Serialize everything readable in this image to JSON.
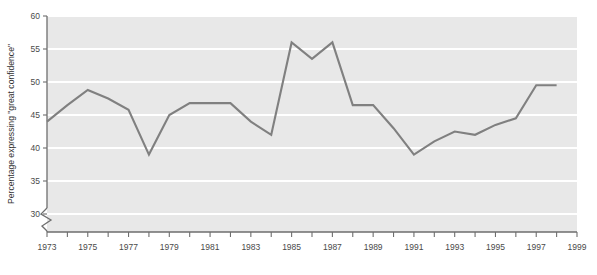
{
  "chart_data": {
    "type": "line",
    "title": "",
    "subtitle": "",
    "xlabel": "",
    "ylabel": "Percentage expressing \"great confidence\"",
    "ylim": [
      30,
      60
    ],
    "xlim": [
      1973,
      1999
    ],
    "ytick_step": 5,
    "ytick_labels": [
      "30",
      "35",
      "40",
      "45",
      "50",
      "55",
      "60"
    ],
    "ytick_values": [
      30,
      35,
      40,
      45,
      50,
      55,
      60
    ],
    "xtick_values": [
      1973,
      1974,
      1975,
      1976,
      1977,
      1978,
      1979,
      1980,
      1981,
      1982,
      1983,
      1984,
      1985,
      1986,
      1987,
      1988,
      1989,
      1990,
      1991,
      1992,
      1993,
      1994,
      1995,
      1996,
      1997,
      1998,
      1999
    ],
    "xtick_labels": [
      "1973",
      "",
      "1975",
      "",
      "1977",
      "",
      "1979",
      "",
      "1981",
      "",
      "1983",
      "",
      "1985",
      "",
      "1987",
      "",
      "1989",
      "",
      "1991",
      "",
      "1993",
      "",
      "1995",
      "",
      "1997",
      "",
      "1999"
    ],
    "grid": true,
    "grid_axis": "y",
    "legend": false,
    "legend_position": "none",
    "axis_break": true,
    "axis_break_axis": "y",
    "axis_break_note": "zigzag break on y-axis below 30",
    "plot_bg_color": "#e8e8e8",
    "gridline_color": "#ffffff",
    "line_color": "#808080",
    "axis_color": "#6e6e6e",
    "x": [
      1973,
      1974,
      1975,
      1976,
      1977,
      1978,
      1979,
      1980,
      1981,
      1982,
      1983,
      1984,
      1985,
      1986,
      1987,
      1988,
      1989,
      1990,
      1991,
      1992,
      1993,
      1994,
      1995,
      1996,
      1997,
      1998
    ],
    "values": [
      44.0,
      46.5,
      48.8,
      47.5,
      45.8,
      39.0,
      45.0,
      46.8,
      46.8,
      46.8,
      44.0,
      42.0,
      56.0,
      53.5,
      56.0,
      46.5,
      46.5,
      43.0,
      39.0,
      41.0,
      42.5,
      42.0,
      43.5,
      44.5,
      49.5,
      49.5
    ],
    "series": [
      {
        "name": "Percentage expressing \"great confidence\"",
        "color": "#808080",
        "values": [
          44.0,
          46.5,
          48.8,
          47.5,
          45.8,
          39.0,
          45.0,
          46.8,
          46.8,
          46.8,
          44.0,
          42.0,
          56.0,
          53.5,
          56.0,
          46.5,
          46.5,
          43.0,
          39.0,
          41.0,
          42.5,
          42.0,
          43.5,
          44.5,
          49.5,
          49.5
        ]
      }
    ]
  }
}
